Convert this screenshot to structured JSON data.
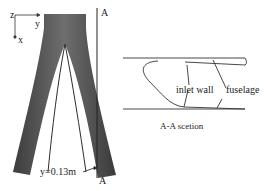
{
  "left_view": {
    "axis_labels": {
      "z": "z",
      "y": "y",
      "x": "x"
    },
    "section_marker_top": "A",
    "section_marker_bottom": "A",
    "position_label": "y=0.13m"
  },
  "right_view": {
    "labels": {
      "inlet_wall": "inlet wall",
      "fuselage": "fuselage"
    },
    "caption": "A-A scetion"
  },
  "colors": {
    "body_dark": "#4a4a4a",
    "body_mid": "#6a6a6a",
    "line": "#333333"
  }
}
